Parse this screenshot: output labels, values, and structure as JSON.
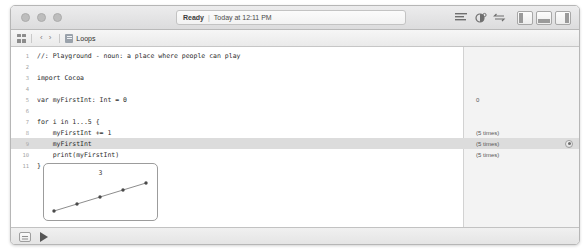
{
  "window": {
    "traffic_lights": [
      "close",
      "minimize",
      "zoom"
    ],
    "status": {
      "state": "Ready",
      "separator": "|",
      "timestamp": "Today at 12:11 PM"
    },
    "toolbar_icons": [
      "editor-options-icon",
      "assistant-editor-icon",
      "version-editor-icon"
    ],
    "panel_toggles": [
      "navigator-panel-toggle",
      "debug-panel-toggle",
      "utilities-panel-toggle"
    ]
  },
  "jumpbar": {
    "grid_icon": "related-items-icon",
    "back_label": "‹",
    "forward_label": "›",
    "file_icon": "playground-file-icon",
    "crumb": "Loops"
  },
  "editor": {
    "lines": [
      {
        "no": "1",
        "code": "//: Playground - noun: a place where people can play",
        "result": ""
      },
      {
        "no": "2",
        "code": "",
        "result": ""
      },
      {
        "no": "3",
        "code": "import Cocoa",
        "result": ""
      },
      {
        "no": "4",
        "code": "",
        "result": ""
      },
      {
        "no": "5",
        "code": "var myFirstInt: Int = 0",
        "result": "0"
      },
      {
        "no": "6",
        "code": "",
        "result": ""
      },
      {
        "no": "7",
        "code": "for i in 1...5 {",
        "result": ""
      },
      {
        "no": "8",
        "code": "    myFirstInt += 1",
        "result": "(5 times)"
      },
      {
        "no": "9",
        "code": "    myFirstInt",
        "result": "(5 times)",
        "highlighted": true,
        "quicklook": true
      },
      {
        "no": "10",
        "code": "    print(myFirstInt)",
        "result": "(5 times)"
      },
      {
        "no": "11",
        "code": "}",
        "result": ""
      }
    ]
  },
  "value_history_graph": {
    "label": "3",
    "points": [
      1,
      2,
      3,
      4,
      5
    ]
  },
  "bottombar": {
    "console_toggle": "console-toggle-button",
    "run_button": "run-playground-button"
  },
  "colors": {
    "highlight_row": "#dcdcdc",
    "results_bg": "#f3f3f3",
    "chrome": "#e8e8e9"
  }
}
